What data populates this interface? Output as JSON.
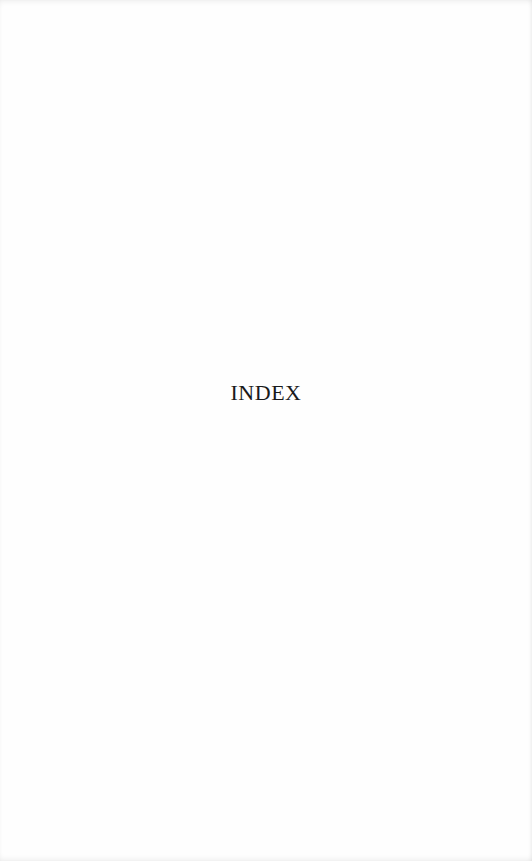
{
  "page": {
    "heading": "INDEX"
  }
}
